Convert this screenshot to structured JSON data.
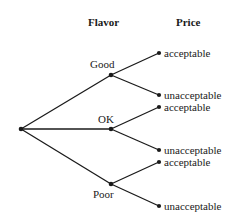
{
  "diagram": {
    "type": "tree",
    "headers": {
      "level1": "Flavor",
      "level2": "Price"
    },
    "root": {
      "id": "root"
    },
    "level1": [
      {
        "id": "good",
        "label": "Good"
      },
      {
        "id": "ok",
        "label": "OK"
      },
      {
        "id": "poor",
        "label": "Poor"
      }
    ],
    "leaves": [
      {
        "parent": "good",
        "label": "acceptable"
      },
      {
        "parent": "good",
        "label": "unacceptable"
      },
      {
        "parent": "ok",
        "label": "acceptable"
      },
      {
        "parent": "ok",
        "label": "unacceptable"
      },
      {
        "parent": "poor",
        "label": "acceptable"
      },
      {
        "parent": "poor",
        "label": "unacceptable"
      }
    ],
    "colors": {
      "line": "#1a1a1a",
      "background": "#ffffff"
    }
  }
}
